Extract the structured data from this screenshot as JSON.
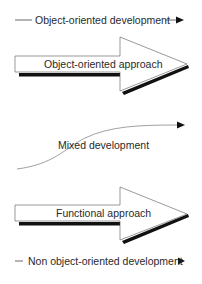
{
  "diagram": {
    "top_flow": {
      "label": "Object-oriented development",
      "icon": "arrow-right-icon"
    },
    "arrow_upper": {
      "label": "Object-oriented approach",
      "shape": "block-arrow-right"
    },
    "mixed_flow": {
      "label": "Mixed development",
      "icon": "arrow-right-icon"
    },
    "arrow_lower": {
      "label": "Functional approach",
      "shape": "block-arrow-right"
    },
    "bottom_flow": {
      "label": "Non object-oriented development",
      "icon": "arrow-right-icon"
    },
    "colors": {
      "line": "#3a3a3a",
      "shadow": "#111111",
      "fill": "#ffffff",
      "text": "#2a2a2a"
    }
  }
}
